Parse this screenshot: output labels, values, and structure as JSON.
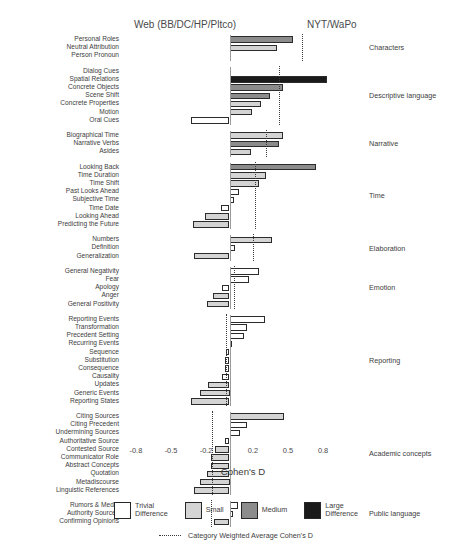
{
  "header": {
    "left": "Web (BB/DC/HP/Pltco)",
    "right": "NYT/WaPo"
  },
  "axis": {
    "xlabel": "Cohen's D",
    "ticks": [
      "-0.8",
      "-0.5",
      "-0.2",
      "0.2",
      "0.5",
      "0.8"
    ],
    "tick_values": [
      -0.8,
      -0.5,
      -0.2,
      0.2,
      0.5,
      0.8
    ]
  },
  "legend": {
    "items": [
      {
        "label": "Trivial\nDifference",
        "level": "trivial",
        "color": "#ffffff"
      },
      {
        "label": "Small",
        "level": "small",
        "color": "#d4d4d4"
      },
      {
        "label": "Medium",
        "level": "medium",
        "color": "#8c8c8c"
      },
      {
        "label": "Large\nDifference",
        "level": "large",
        "color": "#1a1a1a"
      }
    ],
    "avg_label": "Category Weighted Average Cohen's D"
  },
  "chart_data": {
    "type": "bar",
    "orientation": "horizontal",
    "title": "",
    "xlabel": "Cohen's D",
    "ylabel": "",
    "xlim": [
      -0.95,
      0.95
    ],
    "grid": false,
    "left_pole": "Web (BB/DC/HP/Pltco)",
    "right_pole": "NYT/WaPo",
    "legend_position": "bottom",
    "groups": [
      {
        "category": "Characters",
        "weighted_average": 0.62,
        "items": [
          {
            "label": "Personal Roles",
            "value": 0.54,
            "level": "medium"
          },
          {
            "label": "Neutral Attribution",
            "value": 0.41,
            "level": "small"
          },
          {
            "label": "Person Pronoun",
            "value": 0.0,
            "level": "trivial"
          }
        ]
      },
      {
        "category": "Descriptive language",
        "weighted_average": 0.42,
        "items": [
          {
            "label": "Dialog Cues",
            "value": 0.0,
            "level": "trivial"
          },
          {
            "label": "Spatial Relations",
            "value": 0.83,
            "level": "large"
          },
          {
            "label": "Concrete Objects",
            "value": 0.46,
            "level": "medium"
          },
          {
            "label": "Scene Shift",
            "value": 0.35,
            "level": "medium"
          },
          {
            "label": "Concrete Properties",
            "value": 0.27,
            "level": "small"
          },
          {
            "label": "Motion",
            "value": 0.19,
            "level": "small"
          },
          {
            "label": "Oral Cues",
            "value": -0.33,
            "level": "trivial"
          }
        ]
      },
      {
        "category": "Narrative",
        "weighted_average": 0.31,
        "items": [
          {
            "label": "Biographical Time",
            "value": 0.46,
            "level": "small"
          },
          {
            "label": "Narrative Verbs",
            "value": 0.42,
            "level": "medium"
          },
          {
            "label": "Asides",
            "value": 0.18,
            "level": "small"
          }
        ]
      },
      {
        "category": "Time",
        "weighted_average": 0.22,
        "items": [
          {
            "label": "Looking Back",
            "value": 0.74,
            "level": "medium"
          },
          {
            "label": "Time Duration",
            "value": 0.31,
            "level": "small"
          },
          {
            "label": "Time Shift",
            "value": 0.25,
            "level": "small"
          },
          {
            "label": "Past Looks Ahead",
            "value": 0.08,
            "level": "trivial"
          },
          {
            "label": "Subjective Time",
            "value": 0.04,
            "level": "trivial"
          },
          {
            "label": "Time Date",
            "value": -0.07,
            "level": "trivial"
          },
          {
            "label": "Looking Ahead",
            "value": -0.21,
            "level": "small"
          },
          {
            "label": "Predicting the Future",
            "value": -0.31,
            "level": "small"
          }
        ]
      },
      {
        "category": "Elaboration",
        "weighted_average": 0.2,
        "items": [
          {
            "label": "Numbers",
            "value": 0.36,
            "level": "small"
          },
          {
            "label": "Definition",
            "value": 0.05,
            "level": "trivial"
          },
          {
            "label": "Generalization",
            "value": -0.3,
            "level": "small"
          }
        ]
      },
      {
        "category": "Emotion",
        "weighted_average": 0.04,
        "items": [
          {
            "label": "General Negativity",
            "value": 0.25,
            "level": "trivial"
          },
          {
            "label": "Fear",
            "value": 0.17,
            "level": "trivial"
          },
          {
            "label": "Apology",
            "value": -0.06,
            "level": "trivial"
          },
          {
            "label": "Anger",
            "value": -0.14,
            "level": "small"
          },
          {
            "label": "General Positivity",
            "value": -0.19,
            "level": "small"
          }
        ]
      },
      {
        "category": "Reporting",
        "weighted_average": -0.03,
        "items": [
          {
            "label": "Reporting Events",
            "value": 0.3,
            "level": "trivial"
          },
          {
            "label": "Transformation",
            "value": 0.15,
            "level": "trivial"
          },
          {
            "label": "Precedent Setting",
            "value": 0.12,
            "level": "trivial"
          },
          {
            "label": "Recurring Events",
            "value": 0.02,
            "level": "trivial"
          },
          {
            "label": "Sequence",
            "value": -0.03,
            "level": "trivial"
          },
          {
            "label": "Substitution",
            "value": -0.04,
            "level": "trivial"
          },
          {
            "label": "Consequence",
            "value": -0.04,
            "level": "trivial"
          },
          {
            "label": "Causality",
            "value": -0.06,
            "level": "trivial"
          },
          {
            "label": "Updates",
            "value": -0.18,
            "level": "small"
          },
          {
            "label": "Generic Events",
            "value": -0.25,
            "level": "small"
          },
          {
            "label": "Reporting States",
            "value": -0.33,
            "level": "small"
          }
        ]
      },
      {
        "category": "Academic concepts",
        "weighted_average": -0.15,
        "items": [
          {
            "label": "Citing Sources",
            "value": 0.47,
            "level": "small"
          },
          {
            "label": "Citing Precedent",
            "value": 0.15,
            "level": "trivial"
          },
          {
            "label": "Undermining Sources",
            "value": 0.09,
            "level": "trivial"
          },
          {
            "label": "Authoritative Source",
            "value": -0.04,
            "level": "trivial"
          },
          {
            "label": "Contested Source",
            "value": -0.12,
            "level": "small"
          },
          {
            "label": "Communicator Role",
            "value": -0.16,
            "level": "small"
          },
          {
            "label": "Abstract Concepts",
            "value": -0.16,
            "level": "small"
          },
          {
            "label": "Quotation",
            "value": -0.19,
            "level": "small"
          },
          {
            "label": "Metadiscourse",
            "value": -0.25,
            "level": "small"
          },
          {
            "label": "Linguistic References",
            "value": -0.3,
            "level": "small"
          }
        ]
      },
      {
        "category": "Public language",
        "weighted_average": -0.16,
        "items": [
          {
            "label": "Rumors & Media",
            "value": 0.07,
            "level": "trivial"
          },
          {
            "label": "Authority Sources",
            "value": 0.03,
            "level": "trivial"
          },
          {
            "label": "Confirming Opinions",
            "value": -0.13,
            "level": "small"
          }
        ]
      }
    ]
  }
}
